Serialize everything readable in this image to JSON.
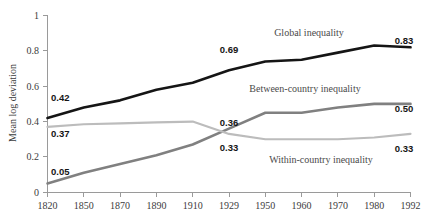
{
  "chart_data": {
    "type": "line",
    "title": "",
    "xlabel": "",
    "ylabel": "Mean log deviation",
    "xlim": [
      1820,
      1992
    ],
    "ylim": [
      0,
      1
    ],
    "grid": false,
    "legend_position": "inline-annotations",
    "x": [
      1820,
      1850,
      1870,
      1890,
      1910,
      1929,
      1950,
      1960,
      1970,
      1980,
      1992
    ],
    "xticklabels": [
      "1820",
      "1850",
      "1870",
      "1890",
      "1910",
      "1929",
      "1950",
      "1960",
      "1970",
      "1980",
      "1992"
    ],
    "yticks": [
      0,
      0.2,
      0.4,
      0.6,
      0.8,
      1
    ],
    "yticklabels": [
      "0",
      "0.2",
      "0.4",
      "0.6",
      "0.8",
      "1"
    ],
    "series": [
      {
        "name": "Global inequality",
        "color": "#151515",
        "width": 2.6,
        "values": [
          0.42,
          0.48,
          0.52,
          0.58,
          0.62,
          0.69,
          0.74,
          0.75,
          0.79,
          0.83,
          0.82
        ],
        "label_color": "#151515"
      },
      {
        "name": "Between-country inequality",
        "color": "#808080",
        "width": 2.6,
        "values": [
          0.05,
          0.11,
          0.16,
          0.21,
          0.27,
          0.36,
          0.45,
          0.45,
          0.48,
          0.5,
          0.5
        ],
        "label_color": "#151515"
      },
      {
        "name": "Within-country inequality",
        "color": "#bcbcbc",
        "width": 2.2,
        "values": [
          0.37,
          0.385,
          0.39,
          0.395,
          0.4,
          0.33,
          0.3,
          0.3,
          0.3,
          0.31,
          0.33
        ],
        "label_color": "#151515"
      }
    ],
    "annotations": [
      {
        "text": "0.42",
        "series": "Global inequality",
        "x": 1820,
        "y": 0.42
      },
      {
        "text": "0.69",
        "series": "Global inequality",
        "x": 1929,
        "y": 0.69
      },
      {
        "text": "0.83",
        "series": "Global inequality",
        "x": 1992,
        "y": 0.83
      },
      {
        "text": "0.05",
        "series": "Between-country inequality",
        "x": 1820,
        "y": 0.05
      },
      {
        "text": "0.36",
        "series": "Between-country inequality",
        "x": 1929,
        "y": 0.36
      },
      {
        "text": "0.50",
        "series": "Between-country inequality",
        "x": 1992,
        "y": 0.5
      },
      {
        "text": "0.37",
        "series": "Within-country inequality",
        "x": 1820,
        "y": 0.37
      },
      {
        "text": "0.33",
        "series": "Within-country inequality",
        "x": 1929,
        "y": 0.33
      },
      {
        "text": "0.33",
        "series": "Within-country inequality",
        "x": 1992,
        "y": 0.33
      }
    ]
  },
  "axis": {
    "ylabel": "Mean log deviation",
    "yticks": [
      "1",
      "0.8",
      "0.6",
      "0.4",
      "0.2",
      "0"
    ],
    "xticks": [
      "1820",
      "1850",
      "1870",
      "1890",
      "1910",
      "1929",
      "1950",
      "1960",
      "1970",
      "1980",
      "1992"
    ]
  },
  "series_labels": {
    "global": "Global inequality",
    "between": "Between-country inequality",
    "within": "Within-country inequality"
  },
  "value_labels": {
    "global_start": "0.42",
    "global_mid": "0.69",
    "global_end": "0.83",
    "between_start": "0.05",
    "between_mid": "0.36",
    "between_end": "0.50",
    "within_start": "0.37",
    "within_mid": "0.33",
    "within_end": "0.33"
  },
  "colors": {
    "global": "#151515",
    "between": "#808080",
    "within": "#bcbcbc",
    "axis": "#9a9a9a",
    "text": "#3c3c3c"
  }
}
